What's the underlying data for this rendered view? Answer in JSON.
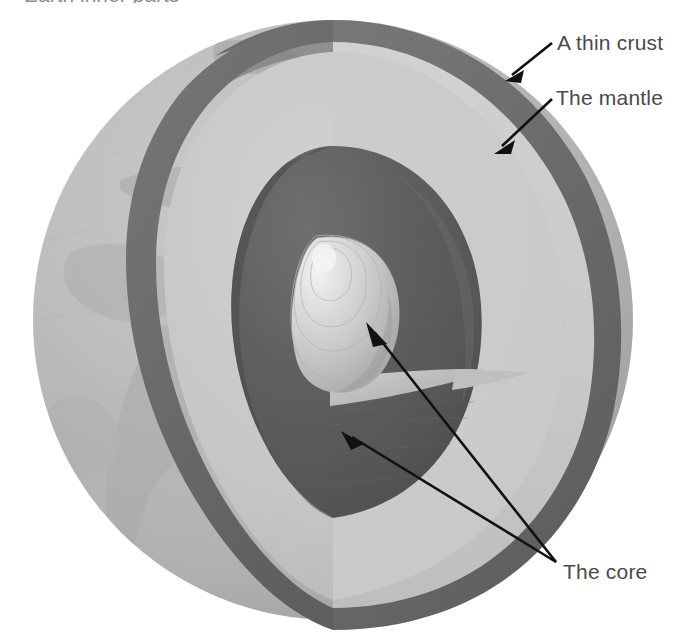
{
  "figure": {
    "title_partial": "Earth inner parts",
    "background_color": "#ffffff",
    "width": 679,
    "height": 637
  },
  "labels": {
    "crust": "A thin crust",
    "mantle": "The mantle",
    "core": "The core"
  },
  "colors": {
    "label_text": "#4a4a4a",
    "caption_text": "#8d8d8d",
    "globe_surface": "#b8b8b8",
    "globe_surface_shadow": "#a6a6a6",
    "crust_band": "#6e6e6e",
    "mantle_light": "#cfcfcf",
    "mantle_mid": "#c2c2c2",
    "mantle_dark": "#b0b0b0",
    "outer_core": "#5c5c5c",
    "outer_core_dark": "#4e4e4e",
    "outer_core_light": "#6d6d6d",
    "inner_core": "#d8d8d8",
    "inner_core_highlight": "#ececec",
    "shelf": "#bdbdbd",
    "arrow": "#111111"
  },
  "structure": {
    "layers": [
      {
        "name": "crust",
        "label": "A thin crust",
        "description": "thin dark outer band"
      },
      {
        "name": "mantle",
        "label": "The mantle",
        "description": "thick light gray layer"
      },
      {
        "name": "outer-core",
        "label": "The core",
        "description": "dark inner cavity"
      },
      {
        "name": "inner-core",
        "label": "The core",
        "description": "bright rounded center with concentric rings"
      }
    ]
  },
  "pointers": [
    {
      "name": "crust-pointer",
      "target": "crust",
      "from": [
        552,
        44
      ],
      "to": [
        500,
        86
      ]
    },
    {
      "name": "mantle-pointer",
      "target": "mantle",
      "from": [
        552,
        100
      ],
      "to": [
        492,
        155
      ]
    },
    {
      "name": "inner-core-pointer",
      "target": "inner-core",
      "from": [
        556,
        563
      ],
      "to": [
        365,
        325
      ]
    },
    {
      "name": "outer-core-pointer",
      "target": "outer-core",
      "from": [
        556,
        563
      ],
      "to": [
        340,
        430
      ]
    }
  ]
}
